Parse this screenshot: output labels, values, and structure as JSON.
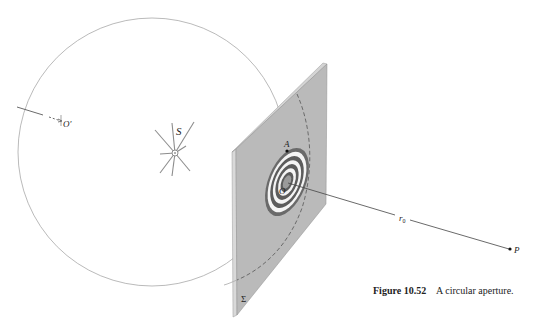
{
  "figure": {
    "labels": {
      "source": "S",
      "aperture_center": "O",
      "zone_edge_point": "A",
      "observation_point": "P",
      "distance": "r",
      "distance_sub": "0",
      "sphere_point": "O′",
      "screen": "Σ"
    },
    "colors": {
      "screen_face": "#b9b9b9",
      "screen_edge": "#d6d6d6",
      "zone_dark": "#5c5c5c",
      "zone_light": "#f4f4f4",
      "wavefront": "#9a9a9a",
      "line": "#444444",
      "source_rays": "#8d8d8d"
    },
    "zone_count": 4
  },
  "caption": {
    "number": "Figure 10.52",
    "text": "A circular aperture."
  }
}
